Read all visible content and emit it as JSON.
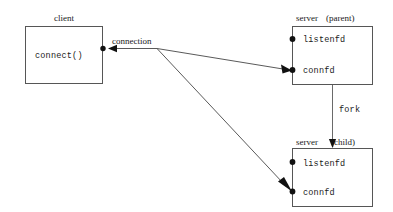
{
  "diagram": {
    "title_text": "TCP server fork connection diagram",
    "background_color": "#ffffff",
    "line_color": "#5a5a5a",
    "box_stroke_color": "#565656",
    "marker_color": "#111111",
    "boxes": [
      {
        "id": "client",
        "label": "client",
        "inner_labels": [
          "connect()"
        ]
      },
      {
        "id": "server-parent",
        "label_left": "server",
        "label_right": "(parent)",
        "label_full": "server (parent)",
        "ports": [
          "listenfd",
          "connfd"
        ]
      },
      {
        "id": "server-child",
        "label_left": "server",
        "label_right": "(child)",
        "label_full": "server (child)",
        "ports": [
          "listenfd",
          "connfd"
        ]
      }
    ],
    "edges": [
      {
        "id": "connection",
        "label": "connection"
      },
      {
        "id": "fork",
        "label": "fork"
      }
    ],
    "labels": {
      "client": "client",
      "connect": "connect()",
      "connection": "connection",
      "server_parent_left": "server",
      "server_parent_right": "(parent)",
      "server_child_left": "server",
      "server_child_right": "(child)",
      "fork": "fork",
      "listenfd_parent": "listenfd",
      "connfd_parent": "connfd",
      "listenfd_child": "listenfd",
      "connfd_child": "connfd"
    }
  }
}
